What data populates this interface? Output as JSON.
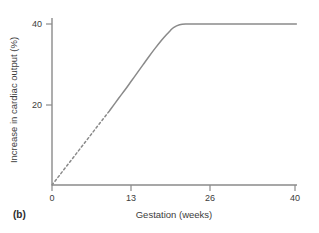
{
  "figure": {
    "panel_label": "(b)",
    "line_color": "#8a8a8a",
    "axis_color": "#8a8a8a",
    "text_color": "#3c3c3c",
    "background": "#ffffff"
  },
  "chart_data": {
    "type": "line",
    "title": "",
    "xlabel": "Gestation (weeks)",
    "ylabel": "Increase in cardiac output (%)",
    "xlim": [
      0,
      40.5
    ],
    "ylim": [
      0,
      41
    ],
    "xticks": [
      0,
      13,
      26,
      40
    ],
    "xtick_labels": [
      "0",
      "13",
      "26",
      "40"
    ],
    "yticks": [
      20,
      40
    ],
    "ytick_labels": [
      "20",
      "40"
    ],
    "grid": false,
    "legend": "none",
    "series": [
      {
        "name": "Increase in cardiac output",
        "style": "dashed",
        "note": "extrapolated early-gestation segment",
        "x": [
          0,
          1,
          2,
          3,
          4,
          5,
          6,
          7,
          8,
          9,
          9.5
        ],
        "y": [
          0,
          1.95,
          3.9,
          5.85,
          7.8,
          9.75,
          11.7,
          13.65,
          15.6,
          17.55,
          18.5
        ]
      },
      {
        "name": "Increase in cardiac output",
        "style": "solid",
        "note": "measured segment rising to plateau at 40%",
        "x": [
          9.5,
          11,
          12,
          13,
          14,
          15,
          16,
          17,
          18,
          19,
          19.5,
          20,
          21,
          22,
          24,
          26,
          30,
          34,
          38,
          40,
          40.2
        ],
        "y": [
          18.5,
          21.6,
          23.6,
          25.7,
          27.8,
          29.9,
          32.0,
          34.0,
          35.9,
          37.6,
          38.4,
          39.1,
          39.8,
          40.0,
          40.0,
          40.0,
          40.0,
          40.0,
          40.0,
          40.0,
          40.0
        ]
      }
    ]
  }
}
